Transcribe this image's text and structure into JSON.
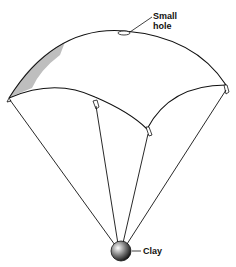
{
  "diagram": {
    "labels": {
      "small_hole_line1": "Small",
      "small_hole_line2": "hole",
      "clay": "Clay"
    },
    "colors": {
      "ink": "#111111",
      "background": "#ffffff"
    }
  }
}
